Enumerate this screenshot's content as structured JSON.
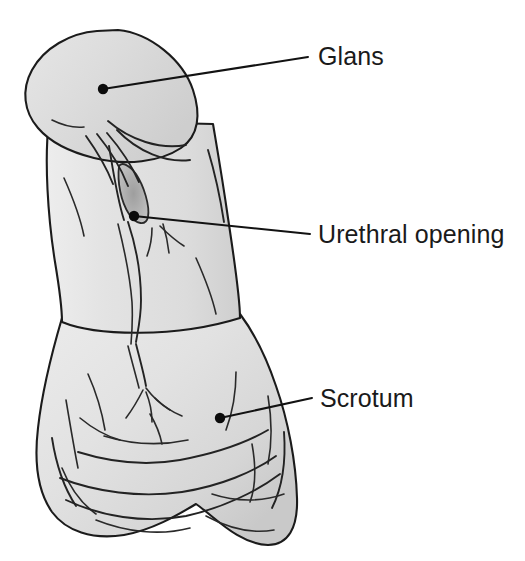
{
  "figure": {
    "type": "anatomical-line-drawing",
    "background_color": "#ffffff",
    "outline_color": "#1b1b1b",
    "label_color": "#1a1a1a",
    "fills": {
      "glans_light": "#dcdcdc",
      "glans_mid": "#d2d2d2",
      "shaft_light": "#e4e4e4",
      "shaft_mid": "#dadada",
      "shaft_shadow": "#c4c4c4",
      "urethra_dark": "#a9a9a9",
      "scrotum_light": "#e6e6e6",
      "scrotum_mid": "#dadada",
      "scrotum_shadow": "#cbcbcb"
    }
  },
  "labels": [
    {
      "id": "glans",
      "text": "Glans",
      "text_x": 318,
      "text_y": 57,
      "dot_x": 103,
      "dot_y": 89,
      "line_end_x": 308,
      "line_end_y": 57
    },
    {
      "id": "urethral-opening",
      "text": "Urethral opening",
      "text_x": 318,
      "text_y": 235,
      "dot_x": 134,
      "dot_y": 216,
      "line_end_x": 310,
      "line_end_y": 234
    },
    {
      "id": "scrotum",
      "text": "Scrotum",
      "text_x": 320,
      "text_y": 399,
      "dot_x": 220,
      "dot_y": 418,
      "line_end_x": 312,
      "line_end_y": 398
    }
  ]
}
